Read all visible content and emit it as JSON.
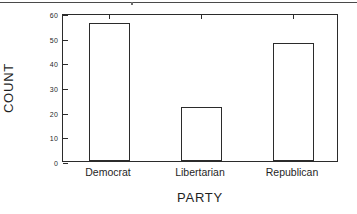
{
  "chart_data": {
    "type": "bar",
    "title": "",
    "subtitle": "",
    "categories": [
      "Democrat",
      "Libertarian",
      "Republican"
    ],
    "values": [
      56,
      22,
      48
    ],
    "xlabel": "PARTY",
    "ylabel": "COUNT",
    "ylim": [
      0,
      60
    ],
    "yticks": [
      0,
      10,
      20,
      30,
      40,
      50,
      60
    ],
    "ytick_labels": [
      "0",
      "10",
      "20",
      "30",
      "40",
      "50",
      "60"
    ],
    "grid": false,
    "legend": false,
    "legend_position": "none",
    "bar_style": {
      "fill_color": "#ffffff",
      "edge_color": "#2b2b2b",
      "orientation": "vertical"
    },
    "frame": {
      "box": true,
      "ticks_on_top_axis": true,
      "ticks_on_bottom_axis": true,
      "tick_direction": "in"
    },
    "annotations": []
  },
  "figure": {
    "axis_line_color": "#2b2b2b",
    "background_color": "#ffffff",
    "text_color": "#1f1f1f"
  },
  "artifacts": {
    "top_rule": "page-edge-rule"
  }
}
